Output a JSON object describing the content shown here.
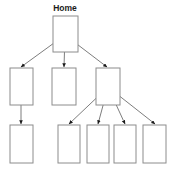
{
  "diagram": {
    "type": "site-map-hierarchy-tree",
    "title": "Home",
    "background_color": "#ffffff",
    "box_fill": "#ffffff",
    "box_stroke": "#8c8c8c",
    "box_stroke_width": 1,
    "connector_color": "#6e6e6e",
    "connector_width": 0.9,
    "arrowhead_color": "#1a1a1a",
    "label_color": "#1a1a1a",
    "levels": 3,
    "node_count": 9,
    "nodes": [
      {
        "id": "home",
        "label": "Home",
        "level": 0,
        "x": 53,
        "y": 16,
        "width": 25,
        "height": 36,
        "label_x": 65,
        "label_y": 11,
        "has_label": true
      },
      {
        "id": "child-1",
        "label": "",
        "level": 1,
        "x": 10,
        "y": 68,
        "width": 23,
        "height": 37,
        "has_label": false
      },
      {
        "id": "child-2",
        "label": "",
        "level": 1,
        "x": 52,
        "y": 68,
        "width": 24,
        "height": 37,
        "has_label": false
      },
      {
        "id": "child-3",
        "label": "",
        "level": 1,
        "x": 96,
        "y": 68,
        "width": 24,
        "height": 37,
        "has_label": false
      },
      {
        "id": "grandchild-1",
        "label": "",
        "level": 2,
        "x": 10,
        "y": 125,
        "width": 23,
        "height": 38,
        "has_label": false
      },
      {
        "id": "grandchild-2",
        "label": "",
        "level": 2,
        "x": 58,
        "y": 125,
        "width": 22,
        "height": 38,
        "has_label": false
      },
      {
        "id": "grandchild-3",
        "label": "",
        "level": 2,
        "x": 87,
        "y": 125,
        "width": 22,
        "height": 38,
        "has_label": false
      },
      {
        "id": "grandchild-4",
        "label": "",
        "level": 2,
        "x": 114,
        "y": 125,
        "width": 22,
        "height": 38,
        "has_label": false
      },
      {
        "id": "grandchild-5",
        "label": "",
        "level": 2,
        "x": 143,
        "y": 125,
        "width": 23,
        "height": 38,
        "has_label": false
      }
    ],
    "connectors": [
      {
        "id": "home-to-child-1",
        "from": "home",
        "to": "child-1",
        "x1": 65,
        "y1": 35,
        "x2": 21,
        "y2": 67
      },
      {
        "id": "home-to-child-2",
        "from": "home",
        "to": "child-2",
        "x1": 65,
        "y1": 35,
        "x2": 64,
        "y2": 67
      },
      {
        "id": "home-to-child-3",
        "from": "home",
        "to": "child-3",
        "x1": 65,
        "y1": 35,
        "x2": 107,
        "y2": 67
      },
      {
        "id": "child-1-to-grandchild-1",
        "from": "child-1",
        "to": "grandchild-1",
        "x1": 21,
        "y1": 80,
        "x2": 21,
        "y2": 124
      },
      {
        "id": "child-3-to-grandchild-2",
        "from": "child-3",
        "to": "grandchild-2",
        "x1": 108,
        "y1": 87,
        "x2": 69,
        "y2": 124
      },
      {
        "id": "child-3-to-grandchild-3",
        "from": "child-3",
        "to": "grandchild-3",
        "x1": 108,
        "y1": 87,
        "x2": 98,
        "y2": 124
      },
      {
        "id": "child-3-to-grandchild-4",
        "from": "child-3",
        "to": "grandchild-4",
        "x1": 108,
        "y1": 87,
        "x2": 125,
        "y2": 124
      },
      {
        "id": "child-3-to-grandchild-5",
        "from": "child-3",
        "to": "grandchild-5",
        "x1": 108,
        "y1": 87,
        "x2": 155,
        "y2": 124
      }
    ]
  }
}
